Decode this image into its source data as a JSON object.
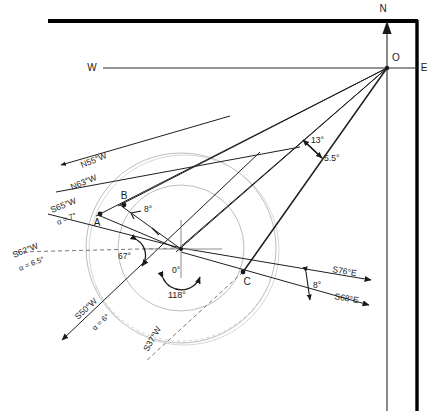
{
  "diagram": {
    "colors": {
      "ink": "#1a1a1a",
      "frame": "#000000",
      "circle": "#b9b9b9",
      "dashed": "#6f6f6f",
      "faint": "#c9c9c9"
    },
    "compass": {
      "north_label": "N",
      "east_label": "E",
      "west_label": "W",
      "origin_label": "O"
    },
    "points": [
      {
        "id": "A",
        "label": "A",
        "x": 100,
        "y": 214
      },
      {
        "id": "B",
        "label": "B",
        "x": 123,
        "y": 203
      },
      {
        "id": "C",
        "label": "C",
        "x": 243,
        "y": 272
      }
    ],
    "bearing_labels": [
      {
        "name": "n55w",
        "text": "N55°W",
        "x": 82,
        "y": 168,
        "rotate": -22
      },
      {
        "name": "n63w",
        "text": "N63°W",
        "x": 72,
        "y": 190,
        "rotate": -22
      },
      {
        "name": "s65w",
        "text": "S65°W",
        "x": 64,
        "y": 211,
        "rotate": -22
      },
      {
        "name": "s65w-alpha",
        "text": "α = 7°",
        "x": 68,
        "y": 224,
        "rotate": -22
      },
      {
        "name": "s62w",
        "text": "S62°W",
        "x": 26,
        "y": 258,
        "rotate": -22
      },
      {
        "name": "s62w-alpha",
        "text": "α = 6.5°",
        "x": 31,
        "y": 271,
        "rotate": -22
      },
      {
        "name": "s50w",
        "text": "S50°W",
        "x": 84,
        "y": 318,
        "rotate": -42
      },
      {
        "name": "s50w-alpha",
        "text": "α = 6°",
        "x": 99,
        "y": 329,
        "rotate": -42
      },
      {
        "name": "s37w",
        "text": "S37°W",
        "x": 155,
        "y": 350,
        "rotate": -60
      },
      {
        "name": "s76e",
        "text": "S76°E",
        "x": 337,
        "y": 275,
        "rotate": 9
      },
      {
        "name": "s68e",
        "text": "S68°E",
        "x": 340,
        "y": 300,
        "rotate": 9
      }
    ],
    "angle_labels": [
      {
        "name": "angle-13",
        "text": "13°",
        "x": 313,
        "y": 140
      },
      {
        "name": "angle-5p5",
        "text": "5.5°",
        "x": 323,
        "y": 157
      },
      {
        "name": "angle-8-ab",
        "text": "8°",
        "x": 142,
        "y": 212
      },
      {
        "name": "angle-67",
        "text": "67°",
        "x": 124,
        "y": 256
      },
      {
        "name": "angle-0",
        "text": "0°",
        "x": 172,
        "y": 271
      },
      {
        "name": "angle-118",
        "text": "118°",
        "x": 172,
        "y": 296
      },
      {
        "name": "angle-8-right",
        "text": "8°",
        "x": 311,
        "y": 286
      }
    ],
    "circles": [
      {
        "name": "inner-circle",
        "cx": 181,
        "cy": 248,
        "r": 63
      },
      {
        "name": "outer-circle",
        "cx": 181,
        "cy": 248,
        "r": 95
      }
    ],
    "center": {
      "x": 181,
      "y": 248
    },
    "origin": {
      "x": 387,
      "y": 68
    }
  }
}
